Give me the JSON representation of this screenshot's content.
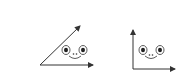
{
  "diagram": {
    "figures": [
      {
        "name": "acute-angle",
        "type": "angle",
        "vertex": [
          40,
          65
        ],
        "rays": [
          [
            93,
            65
          ],
          [
            80,
            26
          ]
        ],
        "face": {
          "eyes": [
            [
              66,
              50
            ],
            [
              83,
              50
            ]
          ],
          "nose": [
            75,
            54
          ],
          "mouth": [
            75,
            56
          ]
        }
      },
      {
        "name": "right-angle",
        "type": "angle",
        "vertex": [
          133,
          69
        ],
        "rays": [
          [
            133,
            30
          ],
          [
            175,
            69
          ]
        ],
        "face": {
          "eyes": [
            [
              143,
              50
            ],
            [
              160,
              50
            ]
          ],
          "nose": [
            151,
            55
          ],
          "mouth": [
            151,
            56
          ]
        }
      }
    ],
    "colors": {
      "stroke": "#333333",
      "background": "#ffffff"
    }
  }
}
